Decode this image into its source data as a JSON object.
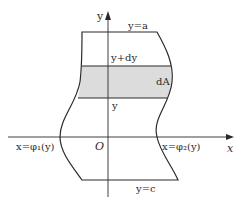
{
  "diagram": {
    "type": "region-integration-figure",
    "axes": {
      "x_label": "x",
      "y_label": "y",
      "origin_label": "O"
    },
    "boundaries": {
      "top": "y=a",
      "bottom": "y=c",
      "left": "x=φ₁(y)",
      "right": "x=φ₂(y)"
    },
    "strip": {
      "upper_label": "y+dy",
      "lower_label": "y",
      "area_label": "dA",
      "fill_color": "#dcdcdc"
    },
    "colors": {
      "line": "#2a2a2a",
      "background": "#ffffff"
    }
  }
}
